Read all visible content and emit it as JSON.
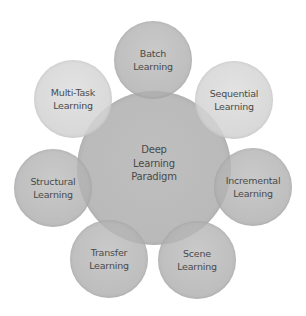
{
  "diagram": {
    "type": "hub-and-spoke",
    "center": {
      "label": "Deep\nLearning\nParadigm",
      "color": "#b4b4b4"
    },
    "nodes": [
      {
        "id": "batch",
        "label": "Batch\nLearning",
        "color": "#b8b8b8"
      },
      {
        "id": "sequential",
        "label": "Sequential\nLearning",
        "color": "#d6d6d6"
      },
      {
        "id": "incremental",
        "label": "Incremental\nLearning",
        "color": "#b4b4b4"
      },
      {
        "id": "scene",
        "label": "Scene\nLearning",
        "color": "#b4b4b4"
      },
      {
        "id": "transfer",
        "label": "Transfer\nLearning",
        "color": "#b4b4b4"
      },
      {
        "id": "structural",
        "label": "Structural\nLearning",
        "color": "#b4b4b4"
      },
      {
        "id": "multi-task",
        "label": "Multi-Task\nLearning",
        "color": "#d2d2d2"
      }
    ],
    "text_color": "#4a4a4a"
  }
}
